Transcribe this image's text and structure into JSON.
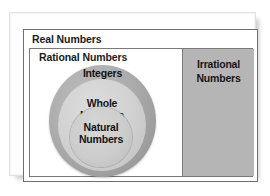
{
  "figure": {
    "type": "nested-set-venn-diagram",
    "title": "Real Numbers",
    "sets": {
      "real": {
        "label": "Real Numbers",
        "border_color": "#6f6f6f",
        "fill_color": "#ffffff"
      },
      "rational": {
        "label": "Rational Numbers",
        "border_color": "#7a7a7a",
        "fill_color": "#ffffff"
      },
      "irrational": {
        "label_line1": "Irrational",
        "label_line2": "Numbers",
        "fill_color": "#b5b5b5"
      },
      "integers": {
        "label": "Integers",
        "fill_color": "#ababab"
      },
      "whole": {
        "label_line1": "Whole",
        "label_line2": "Numbers",
        "fill_color": "#d2d2d2"
      },
      "natural": {
        "label_line1": "Natural",
        "label_line2": "Numbers",
        "fill_color": "#cdcdcd"
      }
    }
  }
}
